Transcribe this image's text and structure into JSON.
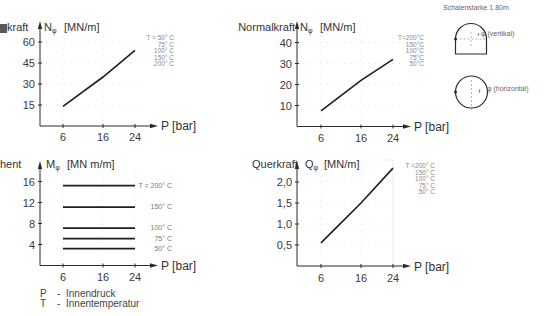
{
  "page": {
    "background": "#ffffff",
    "line_color": "#1e1e1e"
  },
  "diagrams": {
    "shell_thickness_label": "Schalenstarke  1.80m",
    "vertical": {
      "label": "φ (vertikal)"
    },
    "horizontal": {
      "label": "φ (horizontal)"
    }
  },
  "key": {
    "p": {
      "symbol": "P",
      "dash": "-",
      "text": "Innendruck"
    },
    "t": {
      "symbol": "T",
      "dash": "-",
      "text": "Innentemperatur"
    }
  },
  "chart_data": [
    {
      "type": "line",
      "title": "kraft",
      "ylabel_symbol": "N",
      "ylabel_sub": "φ",
      "ylabel_unit": "[MN/m]",
      "xlabel": "P [bar]",
      "x": [
        6,
        16,
        24
      ],
      "xticks": [
        "6",
        "16",
        "24"
      ],
      "yticks": [
        "60",
        "45",
        "30",
        "15"
      ],
      "ylim": [
        0,
        65
      ],
      "grid": true,
      "series": [
        {
          "name": "T = 50°C – 200°C",
          "values": [
            14,
            35,
            54
          ]
        }
      ],
      "temperature_labels": [
        "T = 50° C",
        "75° C",
        "100° C",
        "150° C",
        "200° C"
      ]
    },
    {
      "type": "line",
      "title": "Normalkraft",
      "ylabel_symbol": "N",
      "ylabel_sub": "φ",
      "ylabel_unit": "[MN/m]",
      "xlabel": "P [bar]",
      "x": [
        6,
        16,
        24
      ],
      "xticks": [
        "6",
        "16",
        "24"
      ],
      "yticks": [
        "40",
        "30",
        "20",
        "10"
      ],
      "ylim": [
        0,
        45
      ],
      "grid": true,
      "series": [
        {
          "name": "T = 50°C – 200°C",
          "values": [
            7.5,
            22,
            32
          ]
        }
      ],
      "temperature_labels": [
        "T=200°C",
        "150°C",
        "100°C",
        "75°C",
        "50°C"
      ]
    },
    {
      "type": "line",
      "title": "hent",
      "ylabel_symbol": "M",
      "ylabel_sub": "φ",
      "ylabel_unit": "[MN m/m]",
      "xlabel": "P [bar]",
      "x": [
        6,
        16,
        24
      ],
      "xticks": [
        "6",
        "16",
        "24"
      ],
      "yticks": [
        "16",
        "12",
        "8",
        "4"
      ],
      "ylim": [
        0,
        18
      ],
      "grid": true,
      "series": [
        {
          "name": "T = 200° C",
          "values": [
            15.2,
            15.2,
            15.2
          ]
        },
        {
          "name": "150° C",
          "values": [
            11.1,
            11.1,
            11.1
          ]
        },
        {
          "name": "100° C",
          "values": [
            7.1,
            7.1,
            7.1
          ]
        },
        {
          "name": "75° C",
          "values": [
            5.1,
            5.1,
            5.1
          ]
        },
        {
          "name": "50° C",
          "values": [
            3.2,
            3.2,
            3.2
          ]
        }
      ]
    },
    {
      "type": "line",
      "title": "Querkraft",
      "ylabel_symbol": "Q",
      "ylabel_sub": "φ",
      "ylabel_unit": "[MN/m]",
      "xlabel": "P [bar]",
      "x": [
        6,
        16,
        24
      ],
      "xticks": [
        "6",
        "16",
        "24"
      ],
      "yticks": [
        "2,0",
        "1,5",
        "1,0",
        "0,5"
      ],
      "ylim": [
        0,
        2.4
      ],
      "grid": true,
      "series": [
        {
          "name": "T = 50°C – 200°C",
          "values": [
            0.55,
            1.5,
            2.33
          ]
        }
      ],
      "temperature_labels": [
        "T =200° C",
        "150° C",
        "100° C",
        "75° C",
        "50° C"
      ]
    }
  ]
}
